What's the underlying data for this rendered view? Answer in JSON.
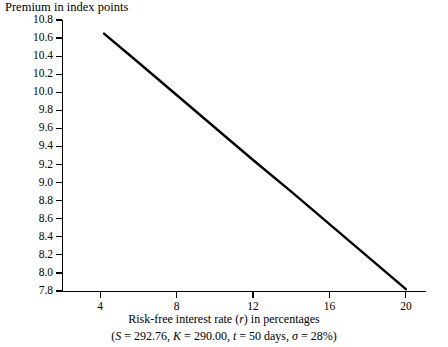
{
  "chart_data": {
    "type": "line",
    "title": "Premium in index points",
    "ylabel": "Premium in index points",
    "xlabel": "Risk-free interest rate (r) in percentages",
    "xlabel_parts": {
      "before": "Risk-free interest rate (",
      "italic": "r",
      "after": ") in percentages"
    },
    "annotation": "(S = 292.76, K = 290.00, t = 50 days, σ = 28%)",
    "annotation_parts": [
      {
        "text": "(",
        "italic": false
      },
      {
        "text": "S",
        "italic": true
      },
      {
        "text": " = 292.76, ",
        "italic": false
      },
      {
        "text": "K",
        "italic": true
      },
      {
        "text": " = 290.00, ",
        "italic": false
      },
      {
        "text": "t",
        "italic": true
      },
      {
        "text": " = 50 days, ",
        "italic": false
      },
      {
        "text": "σ",
        "italic": true
      },
      {
        "text": " = 28%)",
        "italic": false
      }
    ],
    "grid": false,
    "legend": null,
    "xlim": [
      2.0,
      21.0
    ],
    "ylim": [
      7.8,
      10.8
    ],
    "xticks": [
      4,
      8,
      12,
      16,
      20
    ],
    "xtick_labels": [
      "4",
      "8",
      "12",
      "16",
      "20"
    ],
    "yticks": [
      7.8,
      8.0,
      8.2,
      8.4,
      8.6,
      8.8,
      9.0,
      9.2,
      9.4,
      9.6,
      9.8,
      10.0,
      10.2,
      10.4,
      10.6,
      10.8
    ],
    "ytick_labels": [
      "7.8",
      "8.0",
      "8.2",
      "8.4",
      "8.6",
      "8.8",
      "9.0",
      "9.2",
      "9.4",
      "9.6",
      "9.8",
      "10.0",
      "10.2",
      "10.4",
      "10.6",
      "10.8"
    ],
    "series": [
      {
        "name": "Call premium vs risk-free rate",
        "color": "#000000",
        "line_width": 2.4,
        "x": [
          4.2,
          20.0
        ],
        "values": [
          10.65,
          7.82
        ],
        "points": [
          {
            "x": 4.2,
            "y": 10.65
          },
          {
            "x": 6.0,
            "y": 10.33
          },
          {
            "x": 8.0,
            "y": 9.97
          },
          {
            "x": 10.0,
            "y": 9.61
          },
          {
            "x": 12.0,
            "y": 9.25
          },
          {
            "x": 14.0,
            "y": 8.9
          },
          {
            "x": 16.0,
            "y": 8.54
          },
          {
            "x": 18.0,
            "y": 8.18
          },
          {
            "x": 20.0,
            "y": 7.82
          }
        ]
      }
    ],
    "parameters": {
      "S": "292.76",
      "K": "290.00",
      "t": "50 days",
      "sigma": "28%"
    }
  },
  "colors": {
    "background": "#ffffff",
    "foreground": "#000000",
    "line": "#000000"
  }
}
